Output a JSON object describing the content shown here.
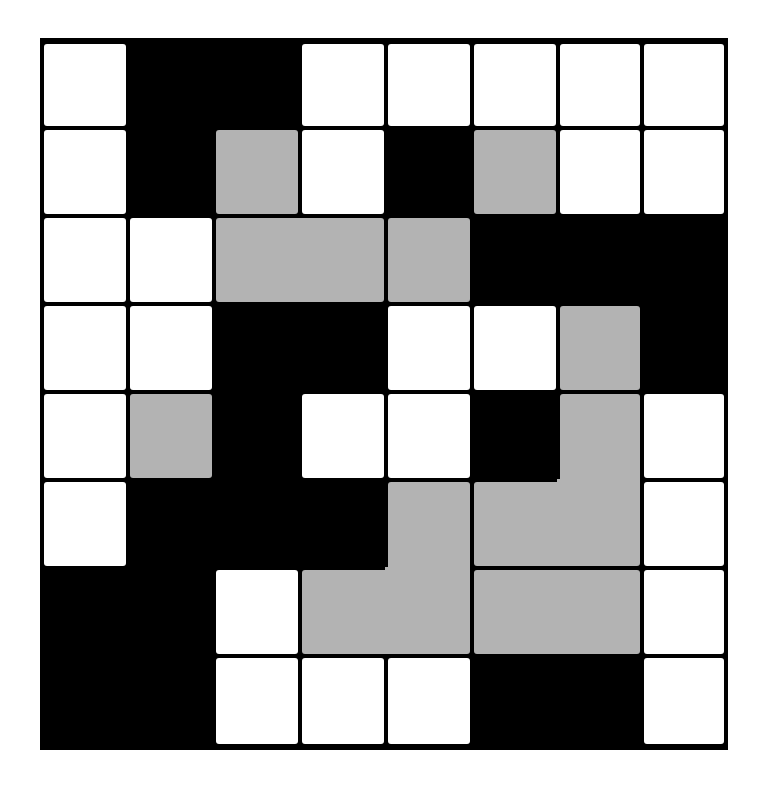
{
  "puzzle": {
    "title": "",
    "rows": 8,
    "cols": 8,
    "colors": {
      "W": "#ffffff",
      "B": "#000000",
      "G": "#b3b3b3"
    },
    "col_edges": [
      42,
      128,
      214,
      300,
      386,
      472,
      558,
      642,
      726
    ],
    "row_edges": [
      42,
      128,
      216,
      304,
      392,
      480,
      568,
      656,
      746
    ],
    "grid": [
      [
        "W",
        "B",
        "B",
        "W",
        "W",
        "W",
        "W",
        "W"
      ],
      [
        "W",
        "B",
        "G",
        "W",
        "B",
        "G",
        "W",
        "W"
      ],
      [
        "W",
        "W",
        "G",
        "G",
        "G",
        "B",
        "B",
        "B"
      ],
      [
        "W",
        "W",
        "B",
        "B",
        "W",
        "W",
        "G",
        "B"
      ],
      [
        "W",
        "G",
        "B",
        "W",
        "W",
        "B",
        "G",
        "W"
      ],
      [
        "W",
        "B",
        "B",
        "B",
        "G",
        "G",
        "G",
        "W"
      ],
      [
        "B",
        "B",
        "W",
        "G",
        "G",
        "G",
        "G",
        "W"
      ],
      [
        "B",
        "B",
        "W",
        "W",
        "W",
        "B",
        "B",
        "W"
      ]
    ],
    "gray_pieces": [
      {
        "name": "gray-piece-1",
        "cells": [
          [
            1,
            2
          ]
        ]
      },
      {
        "name": "gray-piece-2",
        "cells": [
          [
            1,
            5
          ]
        ]
      },
      {
        "name": "gray-piece-3",
        "cells": [
          [
            2,
            2
          ],
          [
            2,
            3
          ]
        ]
      },
      {
        "name": "gray-piece-4",
        "cells": [
          [
            2,
            4
          ]
        ]
      },
      {
        "name": "gray-piece-5",
        "cells": [
          [
            3,
            6
          ]
        ]
      },
      {
        "name": "gray-piece-6",
        "cells": [
          [
            4,
            1
          ]
        ]
      },
      {
        "name": "gray-piece-7",
        "cells": [
          [
            4,
            6
          ],
          [
            5,
            5
          ],
          [
            5,
            6
          ]
        ]
      },
      {
        "name": "gray-piece-8",
        "cells": [
          [
            5,
            4
          ],
          [
            6,
            3
          ],
          [
            6,
            4
          ]
        ]
      },
      {
        "name": "gray-piece-9",
        "cells": [
          [
            6,
            5
          ],
          [
            6,
            6
          ]
        ]
      }
    ]
  }
}
